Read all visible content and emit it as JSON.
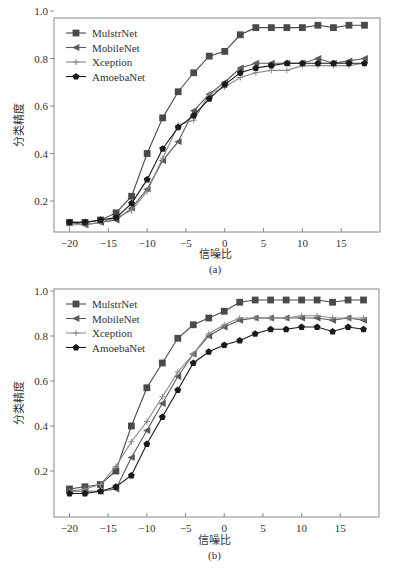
{
  "chart_data": [
    {
      "type": "line",
      "caption": "(a)",
      "title": "",
      "xlabel": "信噪比",
      "ylabel": "分类精度",
      "xlim": [
        -22,
        20
      ],
      "ylim": [
        0.065,
        0.97
      ],
      "xticks": [
        -20,
        -15,
        -10,
        -5,
        0,
        5,
        10,
        15
      ],
      "yticks": [
        0.2,
        0.4,
        0.6,
        0.8,
        1.0
      ],
      "ytick_labels": [
        "0.2",
        "0.4",
        "0.6",
        "0.8",
        "1.0"
      ],
      "grid": false,
      "legend_position": "upper left",
      "x": [
        -20,
        -18,
        -16,
        -14,
        -12,
        -10,
        -8,
        -6,
        -4,
        -2,
        0,
        2,
        4,
        6,
        8,
        10,
        12,
        14,
        16,
        18
      ],
      "series": [
        {
          "name": "MulstrNet",
          "marker": "square",
          "color": "#4a4a4a",
          "values": [
            0.11,
            0.11,
            0.12,
            0.15,
            0.22,
            0.4,
            0.55,
            0.66,
            0.74,
            0.81,
            0.83,
            0.9,
            0.93,
            0.93,
            0.93,
            0.93,
            0.94,
            0.93,
            0.94,
            0.94
          ]
        },
        {
          "name": "MobileNet",
          "marker": "triangle-left",
          "color": "#5a5a5a",
          "values": [
            0.11,
            0.1,
            0.11,
            0.12,
            0.17,
            0.25,
            0.37,
            0.45,
            0.58,
            0.65,
            0.7,
            0.76,
            0.78,
            0.78,
            0.78,
            0.78,
            0.8,
            0.78,
            0.79,
            0.8
          ]
        },
        {
          "name": "Xception",
          "marker": "plus",
          "color": "#888888",
          "values": [
            0.1,
            0.1,
            0.11,
            0.13,
            0.16,
            0.24,
            0.38,
            0.52,
            0.54,
            0.65,
            0.68,
            0.72,
            0.74,
            0.75,
            0.75,
            0.77,
            0.77,
            0.77,
            0.77,
            0.78
          ]
        },
        {
          "name": "AmoebaNet",
          "marker": "circle",
          "color": "#1a1a1a",
          "values": [
            0.11,
            0.11,
            0.12,
            0.13,
            0.19,
            0.29,
            0.42,
            0.51,
            0.56,
            0.63,
            0.69,
            0.74,
            0.76,
            0.77,
            0.78,
            0.78,
            0.78,
            0.78,
            0.78,
            0.78
          ]
        }
      ]
    },
    {
      "type": "line",
      "caption": "(b)",
      "title": "",
      "xlabel": "信噪比",
      "ylabel": "分类精度",
      "xlim": [
        -22,
        20
      ],
      "ylim": [
        0.0,
        1.0
      ],
      "xticks": [
        -20,
        -15,
        -10,
        -5,
        0,
        5,
        10,
        15
      ],
      "yticks": [
        0.2,
        0.4,
        0.6,
        0.8,
        1.0
      ],
      "ytick_labels": [
        "0.2",
        "0.4",
        "0.6",
        "0.8",
        "1.0"
      ],
      "grid": false,
      "legend_position": "upper left",
      "x": [
        -20,
        -18,
        -16,
        -14,
        -12,
        -10,
        -8,
        -6,
        -4,
        -2,
        0,
        2,
        4,
        6,
        8,
        10,
        12,
        14,
        16,
        18
      ],
      "series": [
        {
          "name": "MulstrNet",
          "marker": "square",
          "color": "#4a4a4a",
          "values": [
            0.12,
            0.13,
            0.14,
            0.2,
            0.4,
            0.57,
            0.68,
            0.79,
            0.85,
            0.88,
            0.91,
            0.95,
            0.96,
            0.96,
            0.96,
            0.96,
            0.96,
            0.95,
            0.96,
            0.96
          ]
        },
        {
          "name": "MobileNet",
          "marker": "triangle-left",
          "color": "#5a5a5a",
          "values": [
            0.11,
            0.11,
            0.11,
            0.12,
            0.26,
            0.38,
            0.5,
            0.62,
            0.72,
            0.8,
            0.84,
            0.87,
            0.88,
            0.88,
            0.88,
            0.88,
            0.88,
            0.87,
            0.88,
            0.87
          ]
        },
        {
          "name": "Xception",
          "marker": "plus",
          "color": "#888888",
          "values": [
            0.11,
            0.12,
            0.14,
            0.22,
            0.33,
            0.42,
            0.53,
            0.64,
            0.72,
            0.81,
            0.85,
            0.88,
            0.88,
            0.88,
            0.88,
            0.89,
            0.89,
            0.88,
            0.88,
            0.88
          ]
        },
        {
          "name": "AmoebaNet",
          "marker": "circle",
          "color": "#1a1a1a",
          "values": [
            0.1,
            0.1,
            0.11,
            0.13,
            0.18,
            0.32,
            0.44,
            0.56,
            0.68,
            0.73,
            0.76,
            0.78,
            0.81,
            0.83,
            0.83,
            0.84,
            0.84,
            0.82,
            0.84,
            0.83
          ]
        }
      ]
    }
  ]
}
